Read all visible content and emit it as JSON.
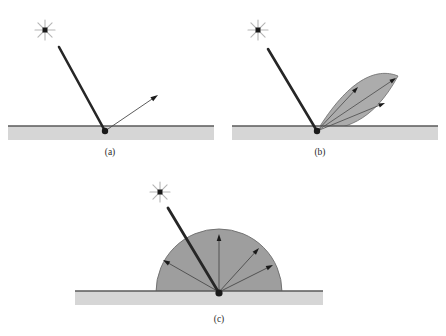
{
  "figure": {
    "background_color": "#ffffff",
    "width": 446,
    "height": 336,
    "panels": [
      {
        "id": "a",
        "label": "(a)",
        "caption_text": "(a)",
        "kind": "ideal-specular-reflection",
        "label_x": 110,
        "label_y": 155,
        "surface": {
          "name": "surface-bar",
          "x": 8,
          "y": 126,
          "width": 206,
          "height": 14,
          "fill_color": "#d6d6d6",
          "top_edge_color": "#5a5a5a",
          "top_edge_width": 1.3
        },
        "light_source": {
          "name": "light-source-star",
          "cx": 45,
          "cy": 30,
          "ray_count": 8,
          "ray_length": 10,
          "ray_color": "#b5b5b5",
          "core_size": 5,
          "core_color": "#1a1a1a"
        },
        "hit_point": {
          "x": 105,
          "y": 131,
          "radius": 3.2,
          "color": "#1a1a1a"
        },
        "incident_ray": {
          "name": "incident-ray",
          "x1": 59,
          "y1": 47,
          "x2": 105,
          "y2": 131,
          "color": "#262626",
          "width": 2.6
        },
        "reflected_rays": [
          {
            "name": "reflected-ray",
            "x1": 105,
            "y1": 131,
            "x2": 158,
            "y2": 95,
            "color": "#4a4a4a",
            "width": 0.9,
            "head_size": 7.5,
            "head_color": "#1a1a1a"
          }
        ]
      },
      {
        "id": "b",
        "label": "(b)",
        "caption_text": "(b)",
        "kind": "glossy-specular-lobe",
        "label_x": 320,
        "label_y": 155,
        "surface": {
          "name": "surface-bar",
          "x": 232,
          "y": 126,
          "width": 206,
          "height": 14,
          "fill_color": "#d6d6d6",
          "top_edge_color": "#5a5a5a",
          "top_edge_width": 1.3
        },
        "light_source": {
          "name": "light-source-star",
          "cx": 258,
          "cy": 30,
          "ray_count": 8,
          "ray_length": 10,
          "ray_color": "#b5b5b5",
          "core_size": 5,
          "core_color": "#1a1a1a"
        },
        "hit_point": {
          "x": 317,
          "y": 131,
          "radius": 3.2,
          "color": "#1a1a1a"
        },
        "incident_ray": {
          "name": "incident-ray",
          "x1": 268,
          "y1": 49,
          "x2": 317,
          "y2": 131,
          "color": "#262626",
          "width": 2.6
        },
        "lobe": {
          "name": "specular-lobe",
          "fill_color": "#9e9e9e",
          "fill_opacity": 0.85,
          "stroke_color": "#6b6b6b",
          "stroke_width": 0.8,
          "apex_x": 317,
          "apex_y": 131,
          "tip_x": 398,
          "tip_y": 76,
          "upper_ctrl_x": 348,
          "upper_ctrl_y": 80,
          "lower_ctrl_x": 372,
          "lower_ctrl_y": 124
        },
        "reflected_rays": [
          {
            "name": "lobe-ray-outer-upper",
            "x1": 317,
            "y1": 131,
            "x2": 396,
            "y2": 78,
            "color": "#4a4a4a",
            "width": 0.8,
            "head_size": 6.5,
            "head_color": "#1a1a1a"
          },
          {
            "name": "lobe-ray-center",
            "x1": 317,
            "y1": 131,
            "x2": 358,
            "y2": 87,
            "color": "#4a4a4a",
            "width": 0.8,
            "head_size": 6.5,
            "head_color": "#1a1a1a"
          },
          {
            "name": "lobe-ray-outer-lower",
            "x1": 317,
            "y1": 131,
            "x2": 385,
            "y2": 103,
            "color": "#4a4a4a",
            "width": 0.8,
            "head_size": 6.5,
            "head_color": "#1a1a1a"
          }
        ]
      },
      {
        "id": "c",
        "label": "(c)",
        "caption_text": "(c)",
        "kind": "diffuse-lambertian-hemisphere",
        "label_x": 219,
        "label_y": 322,
        "surface": {
          "name": "surface-bar",
          "x": 75,
          "y": 291,
          "width": 248,
          "height": 14,
          "fill_color": "#d6d6d6",
          "top_edge_color": "#5a5a5a",
          "top_edge_width": 1.3
        },
        "light_source": {
          "name": "light-source-star",
          "cx": 160,
          "cy": 192,
          "ray_count": 8,
          "ray_length": 10,
          "ray_color": "#b5b5b5",
          "core_size": 5,
          "core_color": "#1a1a1a"
        },
        "hit_point": {
          "x": 219,
          "y": 293,
          "radius": 3.6,
          "color": "#1a1a1a"
        },
        "incident_ray": {
          "name": "incident-ray",
          "x1": 168,
          "y1": 208,
          "x2": 219,
          "y2": 293,
          "color": "#262626",
          "width": 2.8
        },
        "hemisphere": {
          "name": "diffuse-hemisphere",
          "cx": 219,
          "cy": 292,
          "radius": 63,
          "fill_color": "#9e9e9e",
          "stroke_color": "#6b6b6b",
          "stroke_width": 0.9
        },
        "reflected_rays": [
          {
            "name": "diffuse-ray-1",
            "x1": 219,
            "y1": 292,
            "x2": 163,
            "y2": 260,
            "color": "#4a4a4a",
            "width": 0.9,
            "head_size": 7,
            "head_color": "#1a1a1a"
          },
          {
            "name": "diffuse-ray-2",
            "x1": 219,
            "y1": 292,
            "x2": 219,
            "y2": 234,
            "color": "#4a4a4a",
            "width": 0.9,
            "head_size": 7,
            "head_color": "#1a1a1a"
          },
          {
            "name": "diffuse-ray-3",
            "x1": 219,
            "y1": 292,
            "x2": 259,
            "y2": 248,
            "color": "#4a4a4a",
            "width": 0.9,
            "head_size": 7,
            "head_color": "#1a1a1a"
          },
          {
            "name": "diffuse-ray-4",
            "x1": 219,
            "y1": 292,
            "x2": 273,
            "y2": 265,
            "color": "#4a4a4a",
            "width": 0.9,
            "head_size": 7,
            "head_color": "#1a1a1a"
          }
        ]
      }
    ]
  }
}
